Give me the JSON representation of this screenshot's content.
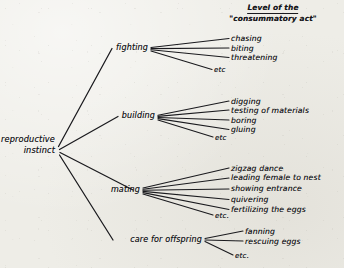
{
  "diagram": {
    "title_heading": {
      "line1": "Level of the",
      "line2": "\"consummatory act\""
    },
    "root": {
      "id": "reproductive-instinct",
      "line1": "reproductive",
      "line2": "instinct",
      "label": "reproductive instinct"
    },
    "branches": [
      {
        "id": "fighting",
        "label": "fighting",
        "leaves": [
          "chasing",
          "biting",
          "threatening"
        ],
        "etc": "etc"
      },
      {
        "id": "building",
        "label": "building",
        "leaves": [
          "digging",
          "testing of materials",
          "boring",
          "gluing"
        ],
        "etc": "etc"
      },
      {
        "id": "mating",
        "label": "mating",
        "leaves": [
          "zigzag dance",
          "leading female to nest",
          "showing entrance",
          "quivering",
          "fertilizing the eggs"
        ],
        "etc": "etc."
      },
      {
        "id": "care-for-offspring",
        "label": "care for offspring",
        "leaves": [
          "fanning",
          "rescuing eggs"
        ],
        "etc": "etc."
      }
    ],
    "colors": {
      "ink": "#17171b",
      "paper": "#eeede7"
    }
  }
}
